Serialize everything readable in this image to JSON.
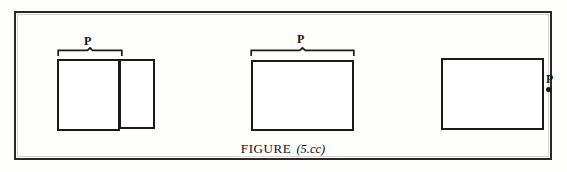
{
  "figure": {
    "caption_word": "FIGURE",
    "caption_reference": "(5.cc)",
    "ink_color": "#1e1a18",
    "frame_color": "#2b2724",
    "background_color": "#fdfdfc"
  },
  "diagrams": [
    {
      "id": "group-one",
      "description": "two adjoining rectangles with brace over the left rectangle",
      "brace_label": "P",
      "has_brace": true,
      "has_point": false,
      "rectangles": [
        {
          "name": "left-rectangle"
        },
        {
          "name": "right-rectangle"
        }
      ]
    },
    {
      "id": "group-two",
      "description": "single rectangle with brace spanning its full width",
      "brace_label": "P",
      "has_brace": true,
      "has_point": false,
      "rectangles": [
        {
          "name": "rectangle"
        }
      ]
    },
    {
      "id": "group-three",
      "description": "single rectangle with point P marked outside to the right",
      "point_label": "P",
      "has_brace": false,
      "has_point": true,
      "rectangles": [
        {
          "name": "rectangle"
        }
      ]
    }
  ]
}
